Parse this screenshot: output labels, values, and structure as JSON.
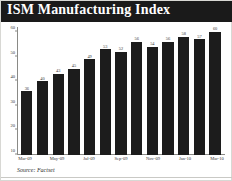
{
  "header": {
    "title": "ISM Manufacturing Index"
  },
  "footer": {
    "source": "Source: Factset"
  },
  "colors": {
    "title_bar_background": "#1a1a1a",
    "title_text": "#ffffff",
    "bar_fill": "#1c1c1c",
    "axis_line": "#8a8a86",
    "tick_text": "#3a3a3a",
    "panel_background": "#ffffff"
  },
  "chart_data": {
    "type": "bar",
    "title": "ISM Manufacturing Index",
    "xlabel": "",
    "ylabel": "",
    "ylim": [
      10,
      62
    ],
    "yticks": [
      10,
      20,
      30,
      40,
      50,
      60
    ],
    "grid": false,
    "legend": null,
    "categories": [
      "Mar-09",
      "Apr-09",
      "May-09",
      "Jun-09",
      "Jul-09",
      "Aug-09",
      "Sep-09",
      "Oct-09",
      "Nov-09",
      "Dec-09",
      "Jan-10",
      "Feb-10",
      "Mar-10"
    ],
    "values": [
      36,
      40,
      43,
      45,
      49,
      53,
      52,
      56,
      54,
      56,
      58,
      57,
      60
    ],
    "tick_labels": [
      "Mar-09",
      "May-09",
      "Jul-09",
      "Sep-09",
      "Nov-09",
      "Jan-10",
      "Mar-10"
    ],
    "tick_label_indices": [
      0,
      2,
      4,
      6,
      8,
      10,
      12
    ],
    "data_labels": [
      "36",
      "40",
      "43",
      "45",
      "49",
      "53",
      "52",
      "56",
      "54",
      "56",
      "58",
      "57",
      "60"
    ]
  }
}
